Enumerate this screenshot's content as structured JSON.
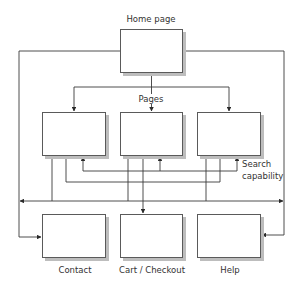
{
  "diagram": {
    "labels": {
      "home": "Home page",
      "pages": "Pages",
      "search_line1": "Search",
      "search_line2": "capability",
      "contact": "Contact",
      "cart": "Cart / Checkout",
      "help": "Help"
    },
    "nodes": [
      {
        "id": "home",
        "label": "Home page",
        "x": 120,
        "y": 29,
        "w": 63,
        "h": 44
      },
      {
        "id": "page1",
        "label": "",
        "x": 42,
        "y": 112,
        "w": 64,
        "h": 44
      },
      {
        "id": "page2",
        "label": "",
        "x": 120,
        "y": 112,
        "w": 63,
        "h": 44
      },
      {
        "id": "page3",
        "label": "",
        "x": 197,
        "y": 112,
        "w": 64,
        "h": 44
      },
      {
        "id": "contact",
        "label": "Contact",
        "x": 42,
        "y": 214,
        "w": 64,
        "h": 44
      },
      {
        "id": "cart",
        "label": "Cart / Checkout",
        "x": 120,
        "y": 214,
        "w": 63,
        "h": 44
      },
      {
        "id": "help",
        "label": "Help",
        "x": 197,
        "y": 214,
        "w": 64,
        "h": 44
      }
    ],
    "edges": [
      {
        "from": "home",
        "to": "page1"
      },
      {
        "from": "home",
        "to": "page2"
      },
      {
        "from": "home",
        "to": "page3"
      },
      {
        "from": "home",
        "to": "contact"
      },
      {
        "from": "home",
        "to": "help"
      },
      {
        "from": "pages",
        "to": "search",
        "label": "Search capability"
      },
      {
        "from": "page2",
        "to": "cart"
      },
      {
        "from": "pages",
        "to": "global-nav",
        "bidirectional": true
      }
    ],
    "colors": {
      "line": "#3a3a3a",
      "box_border": "#5a5a5a",
      "shadow": "#bdbdbd",
      "text": "#333333"
    }
  }
}
